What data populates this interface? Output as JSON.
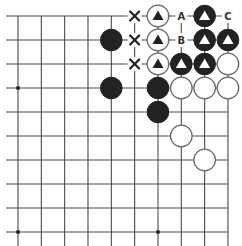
{
  "diagram": {
    "type": "go-board-fragment",
    "board_size": 19,
    "visible_region": {
      "corner": "top-right",
      "columns_visible": 10,
      "rows_visible": 10,
      "edges_shown": [
        "top",
        "right"
      ]
    },
    "star_points": [
      {
        "col": 0,
        "row": 3
      },
      {
        "col": 0,
        "row": 9
      },
      {
        "col": 6,
        "row": 3
      },
      {
        "col": 6,
        "row": 9
      }
    ],
    "stones": [
      {
        "col": 6,
        "row": 0,
        "color": "white",
        "mark": "triangle"
      },
      {
        "col": 8,
        "row": 0,
        "color": "black",
        "mark": "triangle"
      },
      {
        "col": 4,
        "row": 1,
        "color": "black",
        "mark": ""
      },
      {
        "col": 6,
        "row": 1,
        "color": "white",
        "mark": "triangle"
      },
      {
        "col": 8,
        "row": 1,
        "color": "black",
        "mark": "triangle"
      },
      {
        "col": 9,
        "row": 1,
        "color": "black",
        "mark": "triangle"
      },
      {
        "col": 6,
        "row": 2,
        "color": "white",
        "mark": "triangle"
      },
      {
        "col": 7,
        "row": 2,
        "color": "black",
        "mark": "triangle"
      },
      {
        "col": 8,
        "row": 2,
        "color": "black",
        "mark": "triangle"
      },
      {
        "col": 9,
        "row": 2,
        "color": "white",
        "mark": ""
      },
      {
        "col": 4,
        "row": 3,
        "color": "black",
        "mark": ""
      },
      {
        "col": 6,
        "row": 3,
        "color": "black",
        "mark": ""
      },
      {
        "col": 7,
        "row": 3,
        "color": "white",
        "mark": ""
      },
      {
        "col": 8,
        "row": 3,
        "color": "white",
        "mark": ""
      },
      {
        "col": 9,
        "row": 3,
        "color": "white",
        "mark": ""
      },
      {
        "col": 6,
        "row": 4,
        "color": "black",
        "mark": ""
      },
      {
        "col": 7,
        "row": 5,
        "color": "white",
        "mark": ""
      },
      {
        "col": 8,
        "row": 6,
        "color": "white",
        "mark": ""
      }
    ],
    "x_marks": [
      {
        "col": 5,
        "row": 0
      },
      {
        "col": 5,
        "row": 1
      },
      {
        "col": 5,
        "row": 2
      }
    ],
    "letter_labels": [
      {
        "col": 7,
        "row": 0,
        "text": "A"
      },
      {
        "col": 7,
        "row": 1,
        "text": "B"
      },
      {
        "col": 9,
        "row": 0,
        "text": "C"
      }
    ],
    "colors": {
      "black_stone": "#222222",
      "white_stone_outline": "#6a6a6a",
      "grid": "#4a4a4a",
      "background": "#ffffff"
    }
  }
}
